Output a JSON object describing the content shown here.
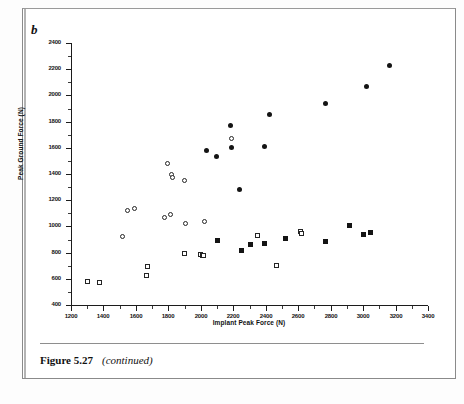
{
  "page": {
    "panel_label": "b",
    "caption_figure_number": "Figure 5.27",
    "caption_note": "(continued)"
  },
  "chart_data": {
    "type": "scatter",
    "title": "",
    "panel": "b",
    "xlabel": "Implant Peak Force (N)",
    "ylabel": "Peak Ground Force (N)",
    "xlim": [
      1200,
      3400
    ],
    "ylim": [
      400,
      2400
    ],
    "xticks": [
      1200,
      1400,
      1600,
      1800,
      2000,
      2200,
      2400,
      2600,
      2800,
      3000,
      3200,
      3400
    ],
    "yticks": [
      400,
      600,
      800,
      1000,
      1200,
      1400,
      1600,
      1800,
      2000,
      2200,
      2400
    ],
    "xtick_labels": [
      "1200",
      "1400",
      "1600",
      "1800",
      "2000",
      "2200",
      "2400",
      "2600",
      "2800",
      "3000",
      "3200",
      "3400"
    ],
    "ytick_labels": [
      "400",
      "600",
      "800",
      "1000",
      "1200",
      "1400",
      "1600",
      "1800",
      "2000",
      "2200",
      "2400"
    ],
    "x_minor_tick_step": 100,
    "y_minor_tick_step": 100,
    "grid": false,
    "legend": null,
    "legend_position": "none",
    "series": [
      {
        "name": "filled-circle",
        "marker": "filled-circle",
        "color": "#141414",
        "points": [
          [
            2035,
            1583
          ],
          [
            2095,
            1533
          ],
          [
            2180,
            1772
          ],
          [
            2190,
            1600
          ],
          [
            2240,
            1283
          ],
          [
            2390,
            1608
          ],
          [
            2425,
            1853
          ],
          [
            2765,
            1937
          ],
          [
            3020,
            2066
          ],
          [
            3165,
            2226
          ]
        ]
      },
      {
        "name": "open-circle",
        "marker": "open-circle",
        "color": "#242424",
        "points": [
          [
            1520,
            926
          ],
          [
            1545,
            1118
          ],
          [
            1590,
            1140
          ],
          [
            1775,
            1068
          ],
          [
            1795,
            1478
          ],
          [
            1815,
            1095
          ],
          [
            1820,
            1393
          ],
          [
            1825,
            1375
          ],
          [
            1900,
            1348
          ],
          [
            1905,
            1021
          ],
          [
            2025,
            1041
          ],
          [
            2190,
            1672
          ]
        ]
      },
      {
        "name": "open-square",
        "marker": "open-square",
        "color": "#242424",
        "points": [
          [
            1300,
            578
          ],
          [
            1375,
            571
          ],
          [
            1665,
            628
          ],
          [
            1670,
            696
          ],
          [
            1900,
            791
          ],
          [
            1995,
            789
          ],
          [
            2010,
            776
          ],
          [
            2015,
            782
          ],
          [
            2250,
            818
          ],
          [
            2350,
            930
          ],
          [
            2465,
            699
          ],
          [
            2615,
            960
          ],
          [
            2620,
            944
          ]
        ]
      },
      {
        "name": "filled-square",
        "marker": "filled-square",
        "color": "#141414",
        "points": [
          [
            2100,
            893
          ],
          [
            2250,
            818
          ],
          [
            2305,
            862
          ],
          [
            2390,
            868
          ],
          [
            2520,
            908
          ],
          [
            2765,
            884
          ],
          [
            2915,
            1008
          ],
          [
            3005,
            942
          ],
          [
            3045,
            950
          ]
        ]
      }
    ]
  }
}
